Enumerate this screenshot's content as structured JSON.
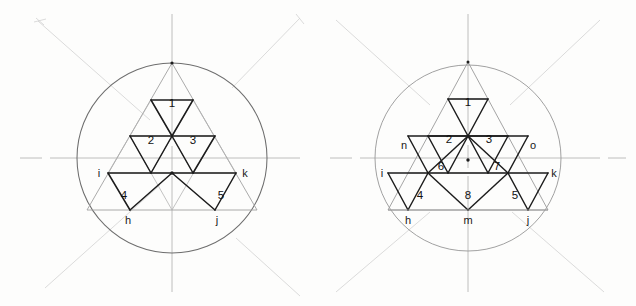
{
  "page": {
    "background_color": "#fdfdfc",
    "ink_color": "#1a1a1a",
    "light_ink_color": "#9a9a9a",
    "faint_pencil_color": "#cfcfcf"
  },
  "figures": [
    {
      "id": "figure-left",
      "name": "left-construction",
      "circle": {
        "cx": 172,
        "cy": 158,
        "r": 95
      },
      "triangle": {
        "apex_x": 172,
        "apex_y": 63,
        "base_left_x": 87,
        "base_right_x": 257,
        "base_y": 210
      },
      "vertex_labels": [
        {
          "text": "i",
          "x": 97,
          "y": 180
        },
        {
          "text": "k",
          "x": 243,
          "y": 180
        },
        {
          "text": "h",
          "x": 126,
          "y": 224
        },
        {
          "text": "j",
          "x": 216,
          "y": 224
        }
      ],
      "region_numbers": [
        {
          "text": "1",
          "x": 172,
          "y": 103
        },
        {
          "text": "2",
          "x": 151,
          "y": 140
        },
        {
          "text": "3",
          "x": 193,
          "y": 140
        },
        {
          "text": "4",
          "x": 122,
          "y": 196
        },
        {
          "text": "5",
          "x": 221,
          "y": 196
        }
      ]
    },
    {
      "id": "figure-right",
      "name": "right-construction",
      "circle": {
        "cx": 468,
        "cy": 158,
        "r": 93
      },
      "triangle": {
        "apex_x": 468,
        "apex_y": 62,
        "base_left_x": 388,
        "base_right_x": 548,
        "base_y": 210
      },
      "vertex_labels": [
        {
          "text": "n",
          "x": 417,
          "y": 150
        },
        {
          "text": "o",
          "x": 518,
          "y": 150
        },
        {
          "text": "i",
          "x": 393,
          "y": 180
        },
        {
          "text": "k",
          "x": 541,
          "y": 180
        },
        {
          "text": "h",
          "x": 425,
          "y": 224
        },
        {
          "text": "m",
          "x": 467,
          "y": 224
        },
        {
          "text": "j",
          "x": 511,
          "y": 224
        }
      ],
      "region_numbers": [
        {
          "text": "1",
          "x": 468,
          "y": 102
        },
        {
          "text": "2",
          "x": 448,
          "y": 138
        },
        {
          "text": "3",
          "x": 488,
          "y": 138
        },
        {
          "text": "6",
          "x": 441,
          "y": 168
        },
        {
          "text": "7",
          "x": 496,
          "y": 168
        },
        {
          "text": "4",
          "x": 421,
          "y": 196
        },
        {
          "text": "8",
          "x": 468,
          "y": 196
        },
        {
          "text": "5",
          "x": 514,
          "y": 196
        }
      ]
    }
  ]
}
